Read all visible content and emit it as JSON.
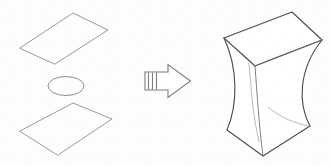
{
  "figure": {
    "background_color": "#fdfdfd",
    "width": 332,
    "height": 166,
    "components": {
      "left_group": {
        "name": "exploded-generator-elements",
        "stroke_color": "#9a9a9a",
        "top_plane": {
          "label": "upper directrix quadrilateral",
          "shape": "parallelogram",
          "points": "20,48 73,13 108,30 55,64"
        },
        "middle_circle": {
          "label": "circular waist directrix",
          "shape": "ellipse",
          "cx": 66,
          "cy": 86,
          "rx": 18,
          "ry": 9.5
        },
        "bottom_plane": {
          "label": "lower directrix quadrilateral",
          "shape": "parallelogram",
          "points": "20,131 73,103 112,119 58,155"
        }
      },
      "arrow": {
        "name": "transformation-arrow",
        "direction": "right",
        "stroke_color": "#7d7d7d",
        "fill_color": "#ffffff",
        "stripe_count": 3,
        "body_points": "145,72 168,72 168,65 190,81 168,97 168,90 145,90"
      },
      "surface": {
        "name": "hyperboloid-of-one-sheet",
        "label": "resulting ruled surface",
        "stroke_color": "#4f4f4f",
        "ruling_color": "#6b6b6b",
        "top_face_points": "224,38 292,12 322,40 255,66",
        "bottom_face_points": "227,130 263,156 310,126 268,107",
        "waist_vertex": "262,78"
      }
    },
    "caption": ""
  }
}
